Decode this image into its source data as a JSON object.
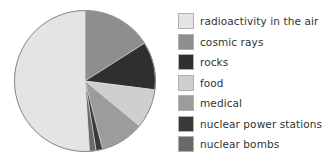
{
  "chart_data": {
    "type": "pie",
    "title": "",
    "start_angle_deg": 0,
    "direction": "clockwise",
    "legend_position": "right",
    "categories": [
      "cosmic rays",
      "rocks",
      "food",
      "medical",
      "nuclear power stations",
      "nuclear bombs",
      "radioactivity in the air"
    ],
    "values": [
      16,
      11,
      9,
      10,
      1.5,
      1.5,
      51
    ],
    "colors": [
      "#8e8e8e",
      "#2f2f2f",
      "#cfcfcf",
      "#9c9c9c",
      "#3a3a3a",
      "#6a6a6a",
      "#e4e4e4"
    ],
    "units": "%"
  },
  "legend": {
    "items": [
      {
        "label": "radioactivity in the air",
        "color": "#e4e4e4"
      },
      {
        "label": "cosmic rays",
        "color": "#8e8e8e"
      },
      {
        "label": "rocks",
        "color": "#2f2f2f"
      },
      {
        "label": "food",
        "color": "#cfcfcf"
      },
      {
        "label": "medical",
        "color": "#9c9c9c"
      },
      {
        "label": "nuclear power stations",
        "color": "#3a3a3a"
      },
      {
        "label": "nuclear bombs",
        "color": "#6a6a6a"
      }
    ]
  },
  "pie": {
    "cx": 85,
    "cy": 81,
    "r": 70.5,
    "outline": "#888888"
  }
}
